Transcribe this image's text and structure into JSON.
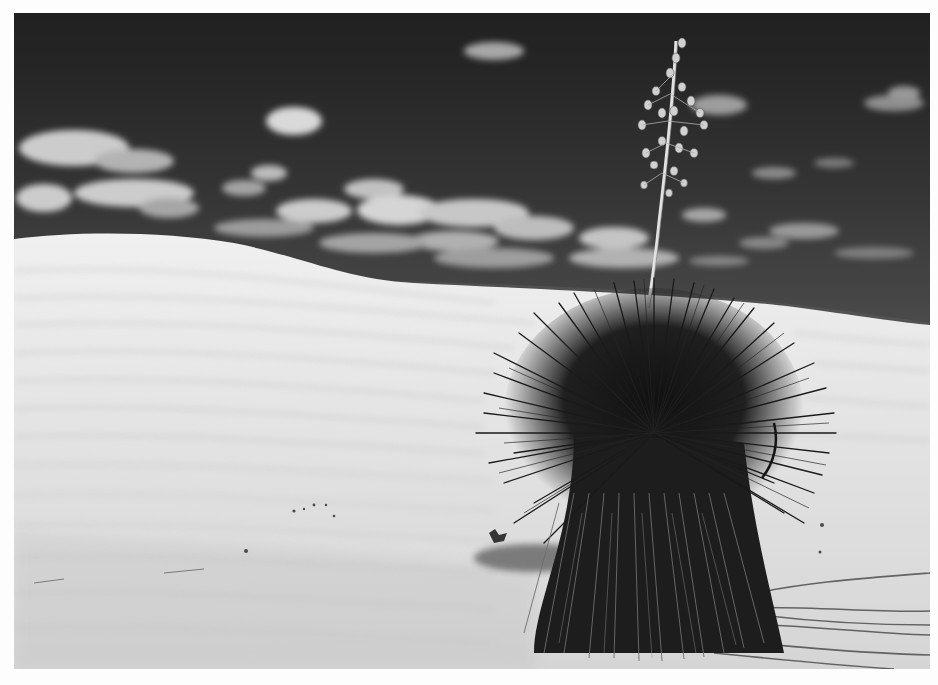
{
  "image": {
    "alt": "Black and white photograph of a soaptree yucca on a white sand dune with a tall flower stalk against a dark sky with scattered cumulus clouds",
    "style": "monochrome",
    "frame_color": "#fdfdfd",
    "palette": {
      "sky_top": "#1f1f1f",
      "sky_bottom": "#4a4a4a",
      "cloud": "#d9d9d9",
      "sand_light": "#f2f2f2",
      "sand_shadow": "#cfcfcf",
      "yucca_dark": "#141414",
      "stalk": "#e6e6e6"
    }
  },
  "scene": {
    "subjects": [
      "yucca-plant",
      "flower-stalk",
      "sand-dune",
      "clouds",
      "sky",
      "shadows"
    ]
  }
}
